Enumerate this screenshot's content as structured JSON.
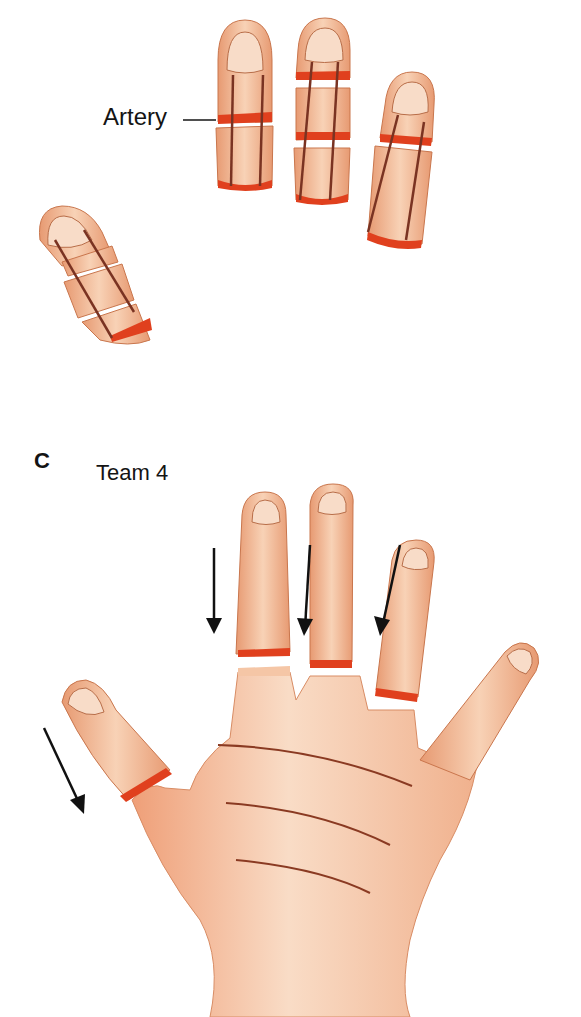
{
  "labels": {
    "artery": "Artery",
    "panel_letter": "C",
    "team": "Team 4"
  },
  "colors": {
    "skin": "#f2b48e",
    "skin_light": "#f8d4ba",
    "skin_shadow": "#d98a62",
    "cut_edge": "#e0401e",
    "artery": "#7a3322",
    "outline": "#c9764d",
    "arrow": "#111111",
    "text": "#141414"
  },
  "panels": [
    {
      "id": "top",
      "description": "Amputated fingers with arteries (harvested digits)",
      "finger_count": 4
    },
    {
      "id": "C",
      "description": "Team 4 — hand with amputation level cuts and arrows",
      "arrow_count": 4
    }
  ]
}
